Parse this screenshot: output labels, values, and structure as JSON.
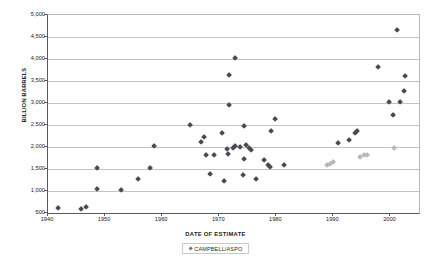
{
  "chart_data": {
    "type": "scatter",
    "title": "",
    "xlabel": "DATE OF ESTIMATE",
    "ylabel": "BILLION BARRELS",
    "xlim": [
      1940,
      2005
    ],
    "ylim": [
      500,
      5000
    ],
    "grid": true,
    "legend_position": "bottom",
    "xticks": [
      1940,
      1950,
      1960,
      1970,
      1980,
      1990,
      2000
    ],
    "xtick_labels": [
      "1940",
      "1950",
      "1960",
      "1970",
      "1980",
      "1990",
      "2000"
    ],
    "yticks": [
      500,
      1000,
      1500,
      2000,
      2500,
      3000,
      3500,
      4000,
      4500,
      5000
    ],
    "ytick_labels": [
      "500",
      "1,000",
      "1,500",
      "2,000",
      "2,500",
      "3,000",
      "3,500",
      "4,000",
      "4,500",
      "5,000"
    ],
    "series": [
      {
        "name": "OTHER ESTIMATES",
        "color": "#4a4a52",
        "marker": "diamond",
        "points": [
          [
            1942.0,
            600
          ],
          [
            1946.0,
            555
          ],
          [
            1946.9,
            620
          ],
          [
            1948.8,
            1500
          ],
          [
            1948.8,
            1010
          ],
          [
            1953.0,
            1000
          ],
          [
            1956.0,
            1250
          ],
          [
            1958.0,
            1500
          ],
          [
            1958.8,
            1995
          ],
          [
            1965.0,
            2480
          ],
          [
            1967.0,
            2085
          ],
          [
            1967.6,
            2200
          ],
          [
            1967.8,
            1790
          ],
          [
            1968.6,
            1360
          ],
          [
            1969.2,
            1790
          ],
          [
            1970.6,
            2285
          ],
          [
            1971.0,
            1205
          ],
          [
            1971.6,
            1930
          ],
          [
            1971.8,
            1810
          ],
          [
            1971.9,
            2930
          ],
          [
            1971.9,
            3620
          ],
          [
            1972.9,
            3990
          ],
          [
            1972.6,
            1950
          ],
          [
            1973.0,
            1990
          ],
          [
            1973.8,
            1965
          ],
          [
            1974.6,
            2450
          ],
          [
            1974.6,
            1700
          ],
          [
            1974.3,
            1330
          ],
          [
            1974.9,
            2015
          ],
          [
            1975.4,
            1955
          ],
          [
            1975.8,
            1915
          ],
          [
            1976.6,
            1245
          ],
          [
            1978.0,
            1690
          ],
          [
            1978.8,
            1560
          ],
          [
            1979.0,
            1510
          ],
          [
            1979.2,
            2340
          ],
          [
            1979.9,
            2620
          ],
          [
            1981.6,
            1565
          ],
          [
            1991.0,
            2070
          ],
          [
            1993.0,
            2135
          ],
          [
            1993.9,
            2290
          ],
          [
            1994.4,
            2330
          ],
          [
            1998.0,
            3785
          ],
          [
            2000.0,
            3000
          ],
          [
            2000.6,
            2695
          ],
          [
            2001.8,
            3000
          ],
          [
            2002.6,
            3240
          ],
          [
            2001.3,
            4640
          ],
          [
            2002.8,
            3585
          ]
        ]
      },
      {
        "name": "CAMPBELL/ASPO",
        "color": "#b6b6bd",
        "marker": "diamond",
        "points": [
          [
            1989.0,
            1565
          ],
          [
            1989.6,
            1600
          ],
          [
            1990.2,
            1640
          ],
          [
            1994.8,
            1740
          ],
          [
            1995.6,
            1790
          ],
          [
            1996.0,
            1800
          ],
          [
            2000.8,
            1950
          ]
        ]
      }
    ],
    "legend": [
      {
        "label": "CAMPBELL/ASPO",
        "color": "#7a7a82"
      }
    ]
  }
}
